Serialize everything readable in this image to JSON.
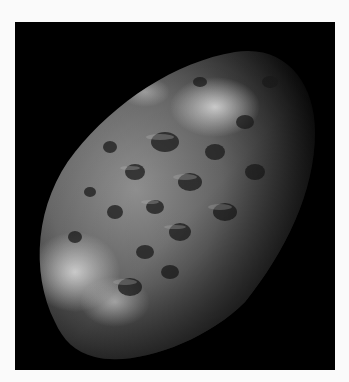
{
  "image": {
    "subject": "cratered sponge-like moon",
    "description": "Grayscale photograph of an irregular, heavily cratered moon against a black space background",
    "colors": {
      "page_background": "#fafafa",
      "space": "#000000",
      "surface_light": "#d8d8d8",
      "surface_mid": "#8a8a8a",
      "surface_dark": "#2a2a2a"
    }
  }
}
